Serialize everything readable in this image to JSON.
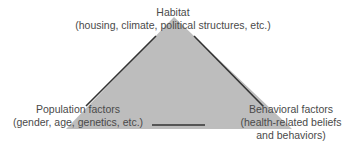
{
  "diagram": {
    "type": "triangle",
    "fill_color": "#bdbdbd",
    "edge_color": "#333333",
    "vertices": {
      "top": {
        "title": "Habitat",
        "subtitle": "(housing, climate, political structures, etc.)"
      },
      "bottom_left": {
        "title": "Population factors",
        "subtitle": "(gender, age, genetics, etc.)"
      },
      "bottom_right": {
        "title": "Behavioral factors",
        "subtitle_line1": "(health-related beliefs",
        "subtitle_line2": "and behaviors)"
      }
    }
  }
}
